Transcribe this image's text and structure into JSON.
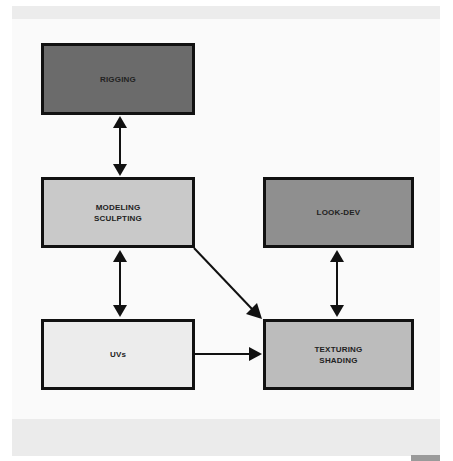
{
  "diagram": {
    "nodes": [
      {
        "id": "rigging",
        "label": "RIGGING",
        "fill": "#6b6b6b",
        "x": 41,
        "y": 43,
        "w": 154,
        "h": 72
      },
      {
        "id": "modeling",
        "label": "MODELING\nSCULPTING",
        "fill": "#c9c9c9",
        "x": 41,
        "y": 177,
        "w": 154,
        "h": 71
      },
      {
        "id": "lookdev",
        "label": "LOOK-DEV",
        "fill": "#8f8f8f",
        "x": 263,
        "y": 177,
        "w": 151,
        "h": 71
      },
      {
        "id": "uvs",
        "label": "UVs",
        "fill": "#ececec",
        "x": 41,
        "y": 319,
        "w": 154,
        "h": 71
      },
      {
        "id": "texturing",
        "label": "TEXTURING\nSHADING",
        "fill": "#bcbcbc",
        "x": 263,
        "y": 319,
        "w": 151,
        "h": 71
      }
    ],
    "edges": [
      {
        "from": "rigging",
        "to": "modeling",
        "type": "bidirectional"
      },
      {
        "from": "modeling",
        "to": "uvs",
        "type": "bidirectional"
      },
      {
        "from": "lookdev",
        "to": "texturing",
        "type": "bidirectional"
      },
      {
        "from": "modeling",
        "to": "texturing",
        "type": "directed"
      },
      {
        "from": "uvs",
        "to": "texturing",
        "type": "directed"
      }
    ]
  },
  "labels": {
    "rigging": "RIGGING",
    "modeling_1": "MODELING",
    "modeling_2": "SCULPTING",
    "lookdev": "LOOK-DEV",
    "uvs": "UVs",
    "texturing_1": "TEXTURING",
    "texturing_2": "SHADING"
  }
}
